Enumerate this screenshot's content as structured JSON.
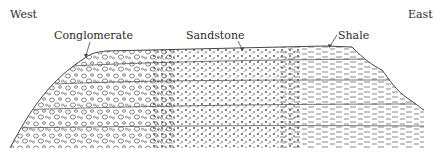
{
  "diagram": {
    "type": "geological-cross-section",
    "direction_labels": {
      "left": "West",
      "right": "East"
    },
    "rock_labels": [
      {
        "name": "Conglomerate",
        "x": 30,
        "y": 23
      },
      {
        "name": "Sandstone",
        "x": 185,
        "y": 23
      },
      {
        "name": "Shale",
        "x": 337,
        "y": 23
      }
    ],
    "facies_gradient": [
      "Conglomerate",
      "Sandstone",
      "Shale"
    ],
    "layer_count": 5,
    "colors": {
      "line": "#444444",
      "background": "#ffffff",
      "text": "#2a2a2a"
    }
  }
}
